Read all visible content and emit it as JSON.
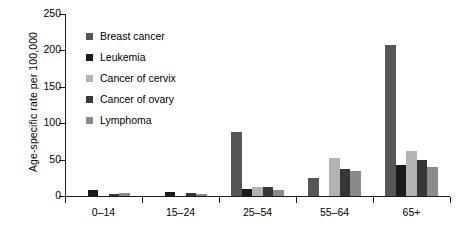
{
  "chart_data": {
    "type": "bar",
    "title": "",
    "xlabel": "",
    "ylabel": "Age-specific rate per 100,000",
    "ylim": [
      0,
      250
    ],
    "yticks": [
      0,
      50,
      100,
      150,
      200,
      250
    ],
    "ytick_labels": [
      "0",
      "50",
      "100",
      "150",
      "200",
      "250"
    ],
    "grid": false,
    "legend_position": "inside-top-left",
    "categories": [
      "0–14",
      "15–24",
      "25–54",
      "55–64",
      "65+"
    ],
    "series": [
      {
        "name": "Breast cancer",
        "color": "#565656",
        "values": [
          0,
          0,
          88,
          25,
          208
        ]
      },
      {
        "name": "Leukemia",
        "color": "#1b1b1b",
        "values": [
          8,
          5,
          10,
          0,
          42
        ]
      },
      {
        "name": "Cancer of cervix",
        "color": "#b3b3b3",
        "values": [
          0,
          0,
          12,
          52,
          62
        ]
      },
      {
        "name": "Cancer of ovary",
        "color": "#373737",
        "values": [
          3,
          4,
          13,
          37,
          49
        ]
      },
      {
        "name": "Lymphoma",
        "color": "#8a8a8a",
        "values": [
          4,
          3,
          8,
          35,
          40
        ]
      }
    ]
  },
  "legend": {
    "items": [
      {
        "label": "Breast cancer",
        "color": "#565656"
      },
      {
        "label": "Leukemia",
        "color": "#1b1b1b"
      },
      {
        "label": "Cancer of cervix",
        "color": "#b3b3b3"
      },
      {
        "label": "Cancer of ovary",
        "color": "#373737"
      },
      {
        "label": "Lymphoma",
        "color": "#8a8a8a"
      }
    ]
  },
  "axis": {
    "y_title": "Age-specific rate per 100,000"
  }
}
